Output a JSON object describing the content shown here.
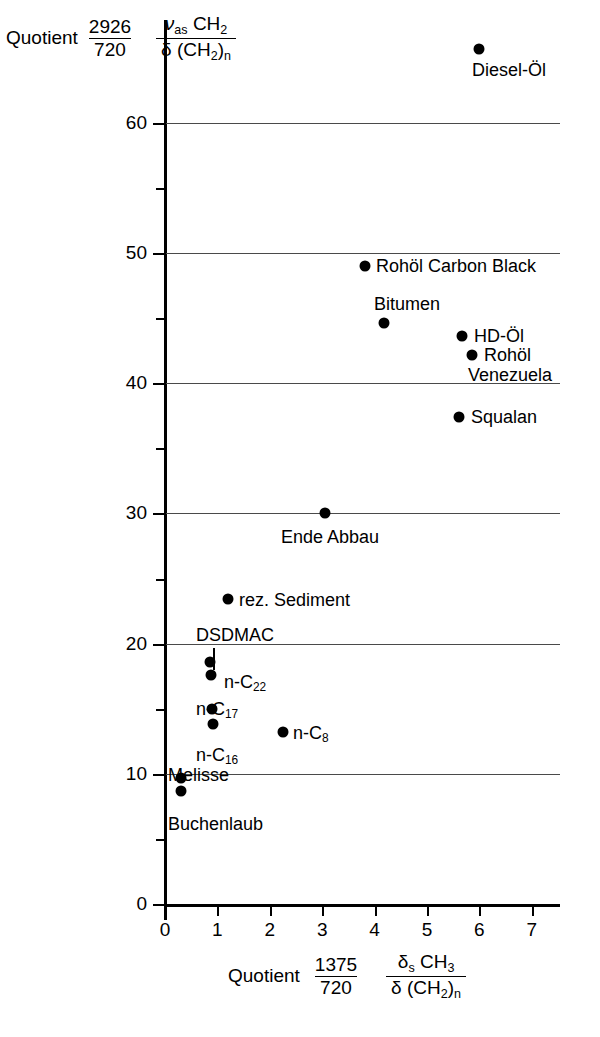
{
  "chart_data": {
    "type": "scatter",
    "title": "",
    "xlabel": "Quotient 1375/720  δs CH3 / δ (CH2)n",
    "ylabel": "Quotient 2926/720  νas CH2 / δ (CH2)n",
    "xlim": [
      0,
      7.6
    ],
    "ylim": [
      0,
      68
    ],
    "grid": true,
    "grid_axis": "y",
    "legend": "none",
    "x_ticks_major": [
      0,
      1,
      2,
      3,
      4,
      5,
      6,
      7
    ],
    "y_ticks_major": [
      0,
      10,
      20,
      30,
      40,
      50,
      60
    ],
    "y_ticks_minor": [
      5,
      15,
      25,
      35,
      45,
      55
    ],
    "points": [
      {
        "label": "Diesel-Öl",
        "x": 5.99,
        "y": 65.7
      },
      {
        "label": "Rohöl Carbon Black",
        "x": 3.82,
        "y": 49.0
      },
      {
        "label": "Bitumen",
        "x": 4.18,
        "y": 44.6
      },
      {
        "label": "HD-Öl",
        "x": 5.67,
        "y": 43.6
      },
      {
        "label": "Rohöl Venezuela",
        "x": 5.86,
        "y": 42.2
      },
      {
        "label": "Squalan",
        "x": 5.61,
        "y": 37.4
      },
      {
        "label": "Ende Abbau",
        "x": 3.05,
        "y": 30.0
      },
      {
        "label": "rez. Sediment",
        "x": 1.2,
        "y": 23.4
      },
      {
        "label": "DSDMAC",
        "x": 0.85,
        "y": 18.6
      },
      {
        "label": "n-C22",
        "x": 0.88,
        "y": 17.6
      },
      {
        "label": "n-C17",
        "x": 0.9,
        "y": 15.0
      },
      {
        "label": "n-C16",
        "x": 0.92,
        "y": 13.8
      },
      {
        "label": "n-C8",
        "x": 2.25,
        "y": 13.2
      },
      {
        "label": "Melisse",
        "x": 0.3,
        "y": 9.7
      },
      {
        "label": "Buchenlaub",
        "x": 0.31,
        "y": 8.7
      }
    ]
  },
  "axes": {
    "y_title": {
      "quotient_word": "Quotient",
      "num": "2926",
      "den": "720",
      "sym_num_a": "ν",
      "sym_num_sub": "as",
      "sym_num_b": "CH",
      "sym_num_b_sub": "2",
      "sym_den_a": "δ",
      "sym_den_b": "(CH",
      "sym_den_b_sub": "2",
      "sym_den_c": ")",
      "sym_den_c_sub": "n"
    },
    "x_title": {
      "quotient_word": "Quotient",
      "num": "1375",
      "den": "720",
      "sym_num_a": "δ",
      "sym_num_sub": "s",
      "sym_num_b": "CH",
      "sym_num_b_sub": "3",
      "sym_den_a": "δ",
      "sym_den_b": "(CH",
      "sym_den_b_sub": "2",
      "sym_den_c": ")",
      "sym_den_c_sub": "n"
    },
    "y_tick_labels": [
      "0",
      "10",
      "20",
      "30",
      "40",
      "50",
      "60"
    ],
    "x_tick_labels": [
      "0",
      "1",
      "2",
      "3",
      "4",
      "5",
      "6",
      "7"
    ]
  },
  "point_labels": {
    "diesel": "Diesel-Öl",
    "rohoel_carbon_black": "Rohöl Carbon Black",
    "bitumen": "Bitumen",
    "hd_oel": "HD-Öl",
    "rohoel_venezuela_1": "Rohöl",
    "rohoel_venezuela_2": "Venezuela",
    "squalan": "Squalan",
    "ende_abbau": "Ende Abbau",
    "rez_sediment": "rez. Sediment",
    "dsdmac": "DSDMAC",
    "nc22_a": "n-C",
    "nc22_b": "22",
    "nc17_a": "n-C",
    "nc17_b": "17",
    "nc16_a": "n-C",
    "nc16_b": "16",
    "nc8_a": "n-C",
    "nc8_b": "8",
    "melisse": "Melisse",
    "buchenlaub": "Buchenlaub"
  },
  "colors": {
    "ink": "#000000",
    "grid": "#4a4a4a",
    "background": "#ffffff"
  }
}
